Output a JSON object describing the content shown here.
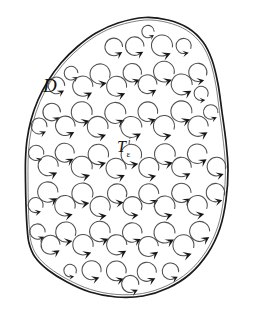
{
  "figure": {
    "kind": "mathematical-diagram",
    "background_color": "#ffffff",
    "boundary_color": "#1a1a1a",
    "mesh_color": "#555555",
    "arrow_color": "#4f4f4f",
    "arrowhead_color": "#171717"
  },
  "labels": {
    "domain": {
      "text": "D",
      "x": 43,
      "y": 92
    },
    "triangle": {
      "base": "T",
      "superscript": "i",
      "subscript": "ε",
      "x": 117,
      "y": 152
    }
  },
  "boundary": {
    "name": "domain-outline",
    "points": [
      [
        145.0,
        17.5
      ],
      [
        168.0,
        20.0
      ],
      [
        188.0,
        28.0
      ],
      [
        203.0,
        42.0
      ],
      [
        212.0,
        60.0
      ],
      [
        218.0,
        84.0
      ],
      [
        222.0,
        112.0
      ],
      [
        226.0,
        142.0
      ],
      [
        228.0,
        170.0
      ],
      [
        226.0,
        200.0
      ],
      [
        220.0,
        228.0
      ],
      [
        208.0,
        253.0
      ],
      [
        190.0,
        274.0
      ],
      [
        168.0,
        288.0
      ],
      [
        143.0,
        296.0
      ],
      [
        116.0,
        297.0
      ],
      [
        90.0,
        292.0
      ],
      [
        67.0,
        282.0
      ],
      [
        48.0,
        270.0
      ],
      [
        35.0,
        257.0
      ],
      [
        29.0,
        243.0
      ],
      [
        27.0,
        226.0
      ],
      [
        26.0,
        205.0
      ],
      [
        25.5,
        182.0
      ],
      [
        25.5,
        160.0
      ],
      [
        27.0,
        140.0
      ],
      [
        31.0,
        120.0
      ],
      [
        38.0,
        100.0
      ],
      [
        48.0,
        81.0
      ],
      [
        61.0,
        63.0
      ],
      [
        77.0,
        47.0
      ],
      [
        96.0,
        33.0
      ],
      [
        118.0,
        23.0
      ]
    ]
  },
  "mesh": {
    "name": "triangular-mesh",
    "nodes": [
      [
        145,
        18
      ],
      [
        119,
        23
      ],
      [
        175,
        22
      ],
      [
        96,
        34
      ],
      [
        199,
        38
      ],
      [
        78,
        47
      ],
      [
        212,
        61
      ],
      [
        62,
        63
      ],
      [
        218,
        85
      ],
      [
        48,
        82
      ],
      [
        222,
        112
      ],
      [
        38,
        101
      ],
      [
        225,
        141
      ],
      [
        31,
        120
      ],
      [
        228,
        169
      ],
      [
        27,
        140
      ],
      [
        226,
        199
      ],
      [
        26,
        162
      ],
      [
        220,
        227
      ],
      [
        25,
        184
      ],
      [
        208,
        252
      ],
      [
        26,
        206
      ],
      [
        190,
        273
      ],
      [
        29,
        229
      ],
      [
        168,
        288
      ],
      [
        36,
        252
      ],
      [
        143,
        296
      ],
      [
        50,
        270
      ],
      [
        116,
        297
      ],
      [
        68,
        283
      ],
      [
        90,
        292
      ]
    ],
    "row_y": [
      18,
      60,
      98,
      140,
      180,
      218,
      258,
      296
    ],
    "triangle_count": 82
  },
  "circulation": {
    "direction": "counterclockwise",
    "glyph": "circular-arrow",
    "radius_px": 10.5,
    "arc_sweep_degrees": 300
  }
}
